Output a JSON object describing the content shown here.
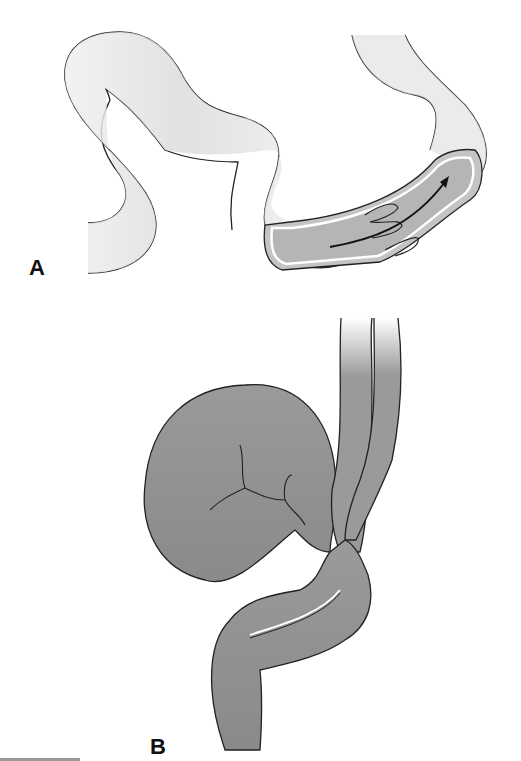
{
  "figure": {
    "panels": [
      {
        "id": "A",
        "label": "A",
        "description": "Intussusception: telescoping segment of bowel with arrow showing direction of invagination"
      },
      {
        "id": "B",
        "label": "B",
        "description": "Volvulus: twisted sigmoid colon loop with distended segment"
      }
    ],
    "colors": {
      "bowel_light": "#e4e4e4",
      "bowel_shade": "#cfcfcf",
      "bowel_dark": "#8e8e8e",
      "outline": "#222222",
      "lumen": "#b8b8b8"
    }
  }
}
